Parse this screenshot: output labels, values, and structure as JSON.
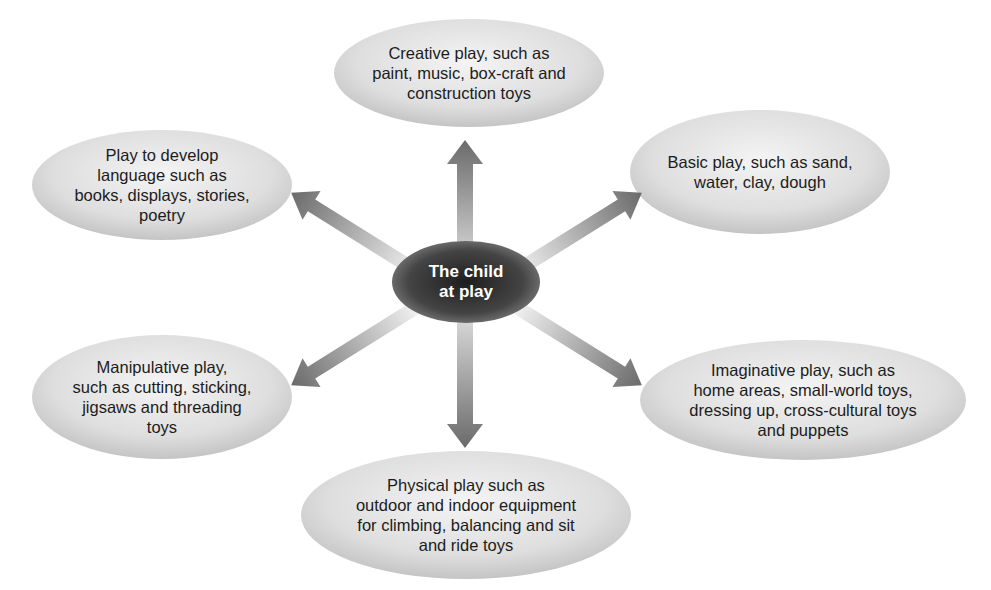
{
  "center": {
    "label": "The child\nat play"
  },
  "nodes": [
    {
      "id": "creative",
      "label": "Creative play, such as\npaint, music, box-craft and\nconstruction toys"
    },
    {
      "id": "language",
      "label": "Play to develop\nlanguage such as\nbooks, displays, stories,\npoetry"
    },
    {
      "id": "basic",
      "label": "Basic play, such as sand,\nwater, clay, dough"
    },
    {
      "id": "manipulative",
      "label": "Manipulative play,\nsuch as cutting, sticking,\njigsaws and threading\ntoys"
    },
    {
      "id": "imaginative",
      "label": "Imaginative play, such as\nhome areas, small-world toys,\ndressing up, cross-cultural toys\nand puppets"
    },
    {
      "id": "physical",
      "label": "Physical play such as\noutdoor and indoor equipment\nfor climbing, balancing and sit\nand ride toys"
    }
  ],
  "colors": {
    "node_fill_light": "#f0f0f0",
    "node_fill_dark": "#c8c8c8",
    "center_fill_light": "#8a8a8a",
    "center_fill_dark": "#2e2e2e",
    "arrow_dark": "#6e6e6e",
    "arrow_light": "#e6e6e6"
  }
}
